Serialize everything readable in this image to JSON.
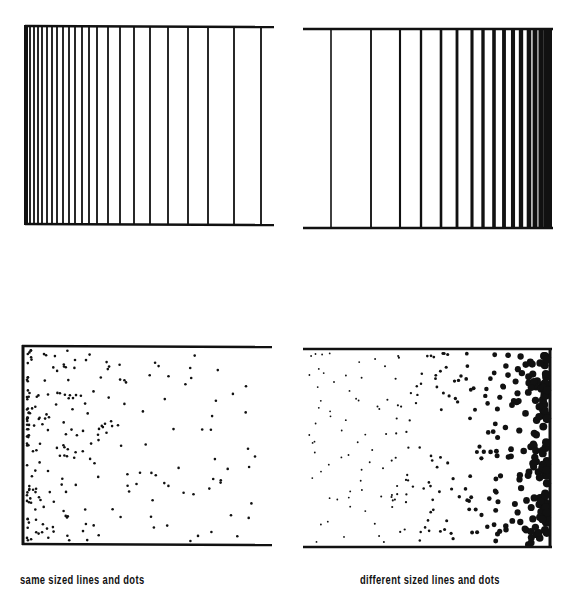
{
  "captions": {
    "left": "same sized lines and dots",
    "right": "different sized lines and dots"
  },
  "panels": [
    {
      "id": "lines-same",
      "type": "lines",
      "description": "vertical lines, equal thickness, spacing dense at left"
    },
    {
      "id": "lines-different",
      "type": "lines",
      "description": "vertical lines, thickness grows toward right, dense at right"
    },
    {
      "id": "dots-same",
      "type": "dots",
      "description": "equal-sized dots, dense at left"
    },
    {
      "id": "dots-different",
      "type": "dots",
      "description": "dot size grows toward right, dense at right"
    }
  ],
  "colors": {
    "ink": "#111111",
    "background": "#ffffff"
  }
}
